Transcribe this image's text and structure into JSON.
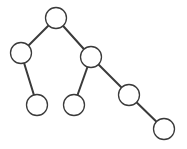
{
  "diagram": {
    "type": "binary-tree",
    "canvas": {
      "width": 187,
      "height": 149
    },
    "style": {
      "background": "#ffffff",
      "node_fill": "#ffffff",
      "node_stroke": "#3a3a3a",
      "edge_stroke": "#3a3a3a",
      "node_radius": 10.5,
      "node_stroke_width": 1.3,
      "edge_stroke_width": 2
    },
    "nodes": [
      {
        "id": "root",
        "label": "",
        "x": 56,
        "y": 18
      },
      {
        "id": "L",
        "label": "",
        "x": 21,
        "y": 53
      },
      {
        "id": "R",
        "label": "",
        "x": 91,
        "y": 57
      },
      {
        "id": "LR",
        "label": "",
        "x": 37,
        "y": 105
      },
      {
        "id": "RL",
        "label": "",
        "x": 74,
        "y": 105
      },
      {
        "id": "RR",
        "label": "",
        "x": 129,
        "y": 95
      },
      {
        "id": "RRR",
        "label": "",
        "x": 164,
        "y": 129
      }
    ],
    "edges": [
      {
        "from": "root",
        "to": "L"
      },
      {
        "from": "root",
        "to": "R"
      },
      {
        "from": "L",
        "to": "LR"
      },
      {
        "from": "R",
        "to": "RL"
      },
      {
        "from": "R",
        "to": "RR"
      },
      {
        "from": "RR",
        "to": "RRR"
      }
    ]
  }
}
